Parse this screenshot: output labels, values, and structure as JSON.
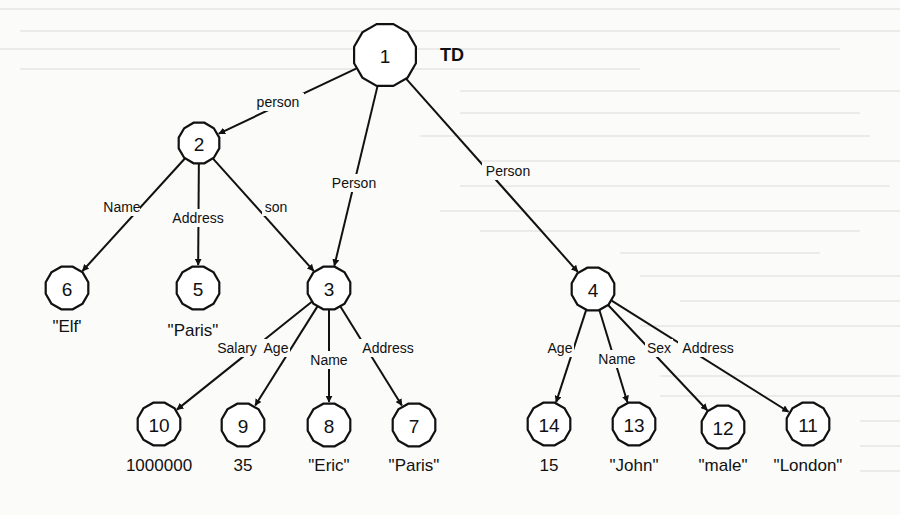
{
  "diagram": {
    "title": "TD",
    "nodes": [
      {
        "id": "1",
        "x": 385,
        "y": 55,
        "r": 32
      },
      {
        "id": "2",
        "x": 199,
        "y": 143,
        "r": 21
      },
      {
        "id": "3",
        "x": 329,
        "y": 288,
        "r": 22
      },
      {
        "id": "4",
        "x": 593,
        "y": 289,
        "r": 22
      },
      {
        "id": "5",
        "x": 198,
        "y": 288,
        "r": 22
      },
      {
        "id": "6",
        "x": 67,
        "y": 288,
        "r": 22
      },
      {
        "id": "7",
        "x": 414,
        "y": 425,
        "r": 22
      },
      {
        "id": "8",
        "x": 329,
        "y": 425,
        "r": 22
      },
      {
        "id": "9",
        "x": 243,
        "y": 425,
        "r": 22
      },
      {
        "id": "10",
        "x": 159,
        "y": 424,
        "r": 22
      },
      {
        "id": "11",
        "x": 808,
        "y": 424,
        "r": 22
      },
      {
        "id": "12",
        "x": 723,
        "y": 427,
        "r": 22
      },
      {
        "id": "13",
        "x": 634,
        "y": 424,
        "r": 22
      },
      {
        "id": "14",
        "x": 549,
        "y": 424,
        "r": 22
      }
    ],
    "edges": [
      {
        "from": "1",
        "to": "2",
        "label": "person",
        "lx": 278,
        "ly": 102
      },
      {
        "from": "1",
        "to": "3",
        "label": "Person",
        "lx": 354,
        "ly": 183
      },
      {
        "from": "1",
        "to": "4",
        "label": "Person",
        "lx": 508,
        "ly": 171
      },
      {
        "from": "2",
        "to": "6",
        "label": "Name",
        "lx": 122,
        "ly": 207
      },
      {
        "from": "2",
        "to": "5",
        "label": "Address",
        "lx": 198,
        "ly": 218
      },
      {
        "from": "2",
        "to": "3",
        "label": "son",
        "lx": 276,
        "ly": 207
      },
      {
        "from": "3",
        "to": "10",
        "label": "Salary",
        "lx": 237,
        "ly": 348
      },
      {
        "from": "3",
        "to": "9",
        "label": "Age",
        "lx": 276,
        "ly": 348
      },
      {
        "from": "3",
        "to": "8",
        "label": "Name",
        "lx": 329,
        "ly": 360
      },
      {
        "from": "3",
        "to": "7",
        "label": "Address",
        "lx": 388,
        "ly": 348
      },
      {
        "from": "4",
        "to": "14",
        "label": "Age",
        "lx": 560,
        "ly": 348
      },
      {
        "from": "4",
        "to": "13",
        "label": "Name",
        "lx": 617,
        "ly": 359
      },
      {
        "from": "4",
        "to": "12",
        "label": "Sex",
        "lx": 659,
        "ly": 348
      },
      {
        "from": "4",
        "to": "11",
        "label": "Address",
        "lx": 708,
        "ly": 348
      }
    ],
    "values": [
      {
        "node": "6",
        "text": "\"Elf'",
        "x": 67,
        "y": 326
      },
      {
        "node": "5",
        "text": "\"Paris\"",
        "x": 193,
        "y": 330
      },
      {
        "node": "10",
        "text": "1000000",
        "x": 159,
        "y": 465
      },
      {
        "node": "9",
        "text": "35",
        "x": 243,
        "y": 465
      },
      {
        "node": "8",
        "text": "\"Eric\"",
        "x": 329,
        "y": 465
      },
      {
        "node": "7",
        "text": "\"Paris\"",
        "x": 414,
        "y": 465
      },
      {
        "node": "14",
        "text": "15",
        "x": 549,
        "y": 465
      },
      {
        "node": "13",
        "text": "\"John\"",
        "x": 634,
        "y": 465
      },
      {
        "node": "12",
        "text": "\"male\"",
        "x": 723,
        "y": 465
      },
      {
        "node": "11",
        "text": "\"London\"",
        "x": 808,
        "y": 465
      }
    ]
  },
  "colors": {
    "ink": "#111111",
    "paper": "#fbfbfa",
    "bleed": "#ecebe8"
  }
}
